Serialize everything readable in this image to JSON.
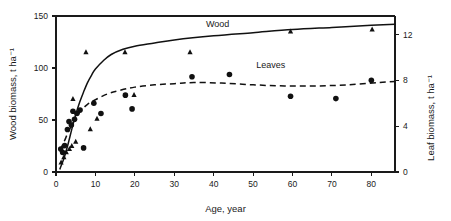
{
  "chart_data": {
    "type": "scatter",
    "title": "",
    "xlabel": "Age, year",
    "ylabel": "Wood biomass, t ha⁻¹",
    "y2label": "Leaf biomass, t ha⁻¹",
    "xlim": [
      0,
      86
    ],
    "ylim": [
      0,
      150
    ],
    "y2lim": [
      0,
      13.6
    ],
    "xticks": [
      0,
      10,
      20,
      30,
      40,
      50,
      60,
      70,
      80
    ],
    "xtick_labels": [
      "0",
      "10",
      "20",
      "30",
      "40",
      "50",
      "60",
      "70",
      "80"
    ],
    "yticks": [
      0,
      50,
      100,
      150
    ],
    "ytick_labels": [
      "0",
      "50",
      "100",
      "150"
    ],
    "y2ticks": [
      0,
      4,
      8,
      12
    ],
    "y2tick_labels": [
      "0",
      "4",
      "8",
      "12"
    ],
    "grid": false,
    "legend_position": "inline-annotation",
    "annotations": [
      {
        "text": "Wood",
        "x": 41.0,
        "y": 139.0,
        "axis": "left"
      },
      {
        "text": "Leaves",
        "x": 54.5,
        "y": 9.1,
        "axis": "right"
      }
    ],
    "series": [
      {
        "name": "Wood",
        "marker": "triangle",
        "axis": "left",
        "points": [
          {
            "x": 1.3,
            "y": 9
          },
          {
            "x": 2.0,
            "y": 14
          },
          {
            "x": 2.6,
            "y": 19
          },
          {
            "x": 3.4,
            "y": 22
          },
          {
            "x": 4.0,
            "y": 25
          },
          {
            "x": 4.3,
            "y": 70
          },
          {
            "x": 5.0,
            "y": 29
          },
          {
            "x": 7.6,
            "y": 115
          },
          {
            "x": 8.7,
            "y": 41
          },
          {
            "x": 10.4,
            "y": 51
          },
          {
            "x": 17.5,
            "y": 115
          },
          {
            "x": 19.8,
            "y": 74
          },
          {
            "x": 34.0,
            "y": 115
          },
          {
            "x": 59.5,
            "y": 135
          },
          {
            "x": 80.2,
            "y": 137
          }
        ]
      },
      {
        "name": "Leaves",
        "marker": "circle",
        "axis": "right",
        "points": [
          {
            "x": 1.2,
            "y": 2.0
          },
          {
            "x": 1.7,
            "y": 1.7
          },
          {
            "x": 2.2,
            "y": 2.3
          },
          {
            "x": 2.9,
            "y": 3.7
          },
          {
            "x": 3.3,
            "y": 4.4
          },
          {
            "x": 3.9,
            "y": 4.1
          },
          {
            "x": 4.3,
            "y": 5.3
          },
          {
            "x": 4.7,
            "y": 4.6
          },
          {
            "x": 5.3,
            "y": 5.1
          },
          {
            "x": 6.1,
            "y": 5.4
          },
          {
            "x": 7.0,
            "y": 2.1
          },
          {
            "x": 9.6,
            "y": 6.0
          },
          {
            "x": 11.4,
            "y": 5.1
          },
          {
            "x": 17.6,
            "y": 6.7
          },
          {
            "x": 19.3,
            "y": 5.5
          },
          {
            "x": 34.5,
            "y": 8.3
          },
          {
            "x": 44.0,
            "y": 8.5
          },
          {
            "x": 59.5,
            "y": 6.6
          },
          {
            "x": 71.0,
            "y": 6.4
          },
          {
            "x": 80.0,
            "y": 8.0
          }
        ]
      }
    ],
    "fit_curves": [
      {
        "name": "Wood fit",
        "style": "solid",
        "axis": "left",
        "points": [
          {
            "x": 1.0,
            "y": 3
          },
          {
            "x": 2.0,
            "y": 13
          },
          {
            "x": 3.0,
            "y": 26
          },
          {
            "x": 4.0,
            "y": 41
          },
          {
            "x": 5.0,
            "y": 55
          },
          {
            "x": 6.0,
            "y": 67
          },
          {
            "x": 7.0,
            "y": 77
          },
          {
            "x": 8.0,
            "y": 86
          },
          {
            "x": 9.0,
            "y": 93
          },
          {
            "x": 10.0,
            "y": 99
          },
          {
            "x": 12.0,
            "y": 107
          },
          {
            "x": 14.0,
            "y": 113
          },
          {
            "x": 17.0,
            "y": 118
          },
          {
            "x": 20.0,
            "y": 121
          },
          {
            "x": 25.0,
            "y": 124
          },
          {
            "x": 30.0,
            "y": 127
          },
          {
            "x": 40.0,
            "y": 131
          },
          {
            "x": 50.0,
            "y": 134
          },
          {
            "x": 60.0,
            "y": 137
          },
          {
            "x": 70.0,
            "y": 139
          },
          {
            "x": 80.0,
            "y": 141
          },
          {
            "x": 86.0,
            "y": 142
          }
        ]
      },
      {
        "name": "Leaves fit",
        "style": "dashed",
        "axis": "right",
        "points": [
          {
            "x": 1.0,
            "y": 1.9
          },
          {
            "x": 2.0,
            "y": 2.6
          },
          {
            "x": 3.0,
            "y": 3.4
          },
          {
            "x": 4.0,
            "y": 4.1
          },
          {
            "x": 5.0,
            "y": 4.7
          },
          {
            "x": 6.5,
            "y": 5.4
          },
          {
            "x": 8.0,
            "y": 5.9
          },
          {
            "x": 10.0,
            "y": 6.3
          },
          {
            "x": 13.0,
            "y": 6.8
          },
          {
            "x": 16.0,
            "y": 7.1
          },
          {
            "x": 20.0,
            "y": 7.4
          },
          {
            "x": 25.0,
            "y": 7.6
          },
          {
            "x": 30.0,
            "y": 7.7
          },
          {
            "x": 35.0,
            "y": 7.8
          },
          {
            "x": 42.0,
            "y": 7.75
          },
          {
            "x": 50.0,
            "y": 7.6
          },
          {
            "x": 58.0,
            "y": 7.5
          },
          {
            "x": 66.0,
            "y": 7.5
          },
          {
            "x": 74.0,
            "y": 7.6
          },
          {
            "x": 82.0,
            "y": 7.8
          },
          {
            "x": 86.0,
            "y": 7.9
          }
        ]
      }
    ]
  },
  "figure": {
    "marker_legend": {
      "triangle_means": "Wood",
      "circle_means": "Leaves"
    }
  }
}
